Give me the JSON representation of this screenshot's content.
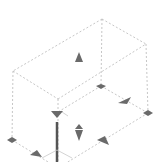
{
  "viewport": {
    "status_text": "",
    "colors": {
      "background": "#ffffff",
      "dashed_edges": "#b8b8b8",
      "handle_fill": "#6a6a6a",
      "axis_bar": "#555555",
      "axis_lines": "#c8c8c8"
    },
    "box_vertices": {
      "top_back": [
        102,
        19
      ],
      "top_right": [
        146,
        44
      ],
      "top_left": [
        13,
        71
      ],
      "top_front": [
        58,
        99
      ],
      "bottom_back": [
        101,
        86
      ],
      "bottom_right": [
        148,
        113
      ],
      "bottom_left": [
        12,
        140
      ],
      "bottom_front": [
        58,
        168
      ]
    },
    "handles": [
      {
        "type": "diamond",
        "name": "corner-handle-back",
        "x": 101,
        "y": 86
      },
      {
        "type": "diamond",
        "name": "corner-handle-right",
        "x": 148,
        "y": 113
      },
      {
        "type": "diamond",
        "name": "corner-handle-left",
        "x": 12,
        "y": 140
      },
      {
        "type": "triangle",
        "name": "top-face-handle",
        "x": 79,
        "y": 58
      },
      {
        "type": "triangle",
        "name": "right-edge-handle",
        "x": 124,
        "y": 100
      },
      {
        "type": "triangle",
        "name": "front-right-handle",
        "x": 103,
        "y": 141
      },
      {
        "type": "triangle",
        "name": "front-left-handle",
        "x": 35,
        "y": 153
      },
      {
        "type": "triangle",
        "name": "front-top-handle",
        "x": 57,
        "y": 113
      },
      {
        "type": "cone",
        "name": "height-handle",
        "x": 79,
        "y": 130
      }
    ]
  }
}
